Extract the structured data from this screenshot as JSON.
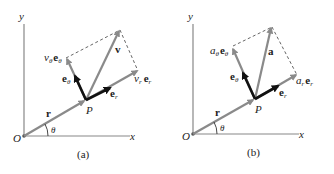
{
  "figure": {
    "panels": [
      {
        "id": "a",
        "caption": "(a)",
        "axis_x_label": "x",
        "axis_y_label": "y",
        "origin_label": "O",
        "point_label": "P",
        "angle_label": "θ",
        "position_vector_label": "r",
        "total_vector_label": "v",
        "radial_component": {
          "coef": "v",
          "sub": "r",
          "unit": "e",
          "unit_sub": "r"
        },
        "transverse_component": {
          "coef": "v",
          "sub": "θ",
          "unit": "e",
          "unit_sub": "θ"
        },
        "unit_radial": {
          "unit": "e",
          "sub": "r"
        },
        "unit_transverse": {
          "unit": "e",
          "sub": "θ"
        }
      },
      {
        "id": "b",
        "caption": "(b)",
        "axis_x_label": "x",
        "axis_y_label": "y",
        "origin_label": "O",
        "point_label": "P",
        "angle_label": "θ",
        "position_vector_label": "r",
        "total_vector_label": "a",
        "radial_component": {
          "coef": "a",
          "sub": "r",
          "unit": "e",
          "unit_sub": "r"
        },
        "transverse_component": {
          "coef": "a",
          "sub": "θ",
          "unit": "e",
          "unit_sub": "θ"
        },
        "unit_radial": {
          "unit": "e",
          "sub": "r"
        },
        "unit_transverse": {
          "unit": "e",
          "sub": "θ"
        }
      }
    ],
    "colors": {
      "component_vectors": "#8a8a8a",
      "unit_vectors": "#111111",
      "axes": "#888888"
    }
  }
}
